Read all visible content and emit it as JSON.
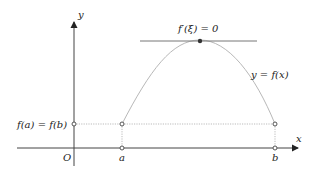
{
  "diagram": {
    "axes": {
      "x_label": "x",
      "y_label": "y",
      "origin_label": "O"
    },
    "points": {
      "a_label": "a",
      "b_label": "b"
    },
    "labels": {
      "level_label": "f(a) = f(b)",
      "curve_label": "y = f(x)",
      "tangent_label": "f′(ξ) = 0"
    },
    "colors": {
      "axis": "#444444",
      "curve": "#b8b8b8",
      "tangent": "#777777",
      "dotted": "#bbbbbb",
      "point": "#555555"
    }
  }
}
